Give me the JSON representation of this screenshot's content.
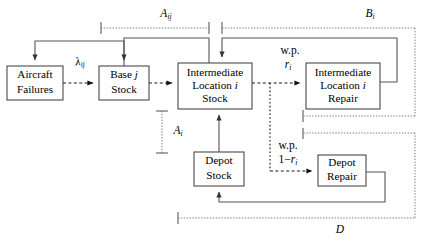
{
  "diagram": {
    "type": "flow-diagram",
    "nodes": [
      {
        "id": "aircraft-failures",
        "lines": [
          "Aircraft",
          "Failures"
        ],
        "x": 7,
        "y": 66,
        "w": 56,
        "h": 34
      },
      {
        "id": "base-stock",
        "lines": [
          "Base j",
          "Stock"
        ],
        "x": 99,
        "y": 66,
        "w": 50,
        "h": 34
      },
      {
        "id": "intermediate-location-stock",
        "lines": [
          "Intermediate",
          "Location i",
          "Stock"
        ],
        "x": 178,
        "y": 63,
        "w": 74,
        "h": 46
      },
      {
        "id": "intermediate-location-repair",
        "lines": [
          "Intermediate",
          "Location i",
          "Repair"
        ],
        "x": 306,
        "y": 63,
        "w": 74,
        "h": 46
      },
      {
        "id": "depot-stock",
        "lines": [
          "Depot",
          "Stock"
        ],
        "x": 194,
        "y": 152,
        "w": 50,
        "h": 34
      },
      {
        "id": "depot-repair",
        "lines": [
          "Depot",
          "Repair"
        ],
        "x": 318,
        "y": 155,
        "w": 48,
        "h": 31
      }
    ],
    "edge_labels": [
      {
        "id": "lambda-ij",
        "base": "λ",
        "subscript": "ij",
        "x": 80,
        "y": 62
      },
      {
        "id": "wp-ri",
        "line1": "w.p.",
        "line2_base": "r",
        "line2_sub": "i",
        "x": 287,
        "y": 51
      },
      {
        "id": "wp-one-minus-ri",
        "line1": "w.p.",
        "line2_base": "1−r",
        "line2_sub": "i",
        "x": 286,
        "y": 158
      }
    ],
    "brackets": [
      {
        "id": "a-ij",
        "label_base": "A",
        "label_sub": "ij",
        "label_x": 166,
        "label_y": 14,
        "orientation": "horizontal",
        "x1": 101,
        "x2": 209,
        "y": 28
      },
      {
        "id": "b-i",
        "label_base": "B",
        "label_sub": "i",
        "label_x": 370,
        "label_y": 14,
        "orientation": "horizontal",
        "x1": 222,
        "x2": 415,
        "y": 28
      },
      {
        "id": "a-i",
        "label_base": "A",
        "label_sub": "i",
        "label_x": 178,
        "label_y": 131,
        "orientation": "vertical",
        "y1": 111,
        "y2": 153,
        "x": 162
      },
      {
        "id": "d",
        "label_base": "D",
        "label_sub": "",
        "label_x": 340,
        "label_y": 230,
        "orientation": "horizontal",
        "x1": 178,
        "x2": 415,
        "y": 218
      }
    ],
    "colors": {
      "box_stroke": "#4a4a4a",
      "solid_edge": "#555555",
      "dashed_edge": "#1a1a1a",
      "bracket": "#7b7b7b",
      "text": "#000000",
      "background": "#ffffff"
    }
  }
}
